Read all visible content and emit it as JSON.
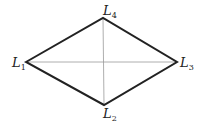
{
  "diagram": {
    "type": "rhombus",
    "vertices": [
      {
        "id": "L1",
        "label": "L",
        "sub": "1",
        "x": 26,
        "y": 62
      },
      {
        "id": "L2",
        "label": "L",
        "sub": "2",
        "x": 104,
        "y": 105
      },
      {
        "id": "L3",
        "label": "L",
        "sub": "3",
        "x": 177,
        "y": 62
      },
      {
        "id": "L4",
        "label": "L",
        "sub": "4",
        "x": 103,
        "y": 18
      }
    ],
    "edges": [
      [
        "L1",
        "L4"
      ],
      [
        "L4",
        "L3"
      ],
      [
        "L3",
        "L2"
      ],
      [
        "L2",
        "L1"
      ]
    ],
    "diagonals": [
      [
        "L1",
        "L3"
      ],
      [
        "L4",
        "L2"
      ]
    ],
    "colors": {
      "edge": "#222222",
      "diagonal": "#999999",
      "label": "#222222"
    }
  }
}
